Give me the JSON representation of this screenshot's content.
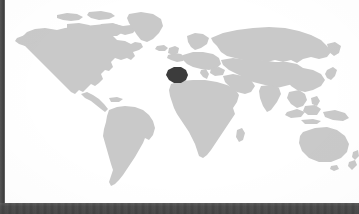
{
  "widget": {
    "name": "world-map",
    "title": "World Map",
    "description": "Grey world map with one country highlighted in dark"
  },
  "map": {
    "projection": "equirectangular",
    "background_color": "#ffffff",
    "land_color": "#c9c9c9",
    "highlight_color": "#3c3c3c",
    "highlighted_region": "Spain",
    "continents": [
      "North America",
      "South America",
      "Europe",
      "Africa",
      "Asia",
      "Australia",
      "Greenland"
    ]
  },
  "chrome": {
    "left_bar_color": "#4a4a4a",
    "bottom_bar_color": "#4a4a4a"
  }
}
